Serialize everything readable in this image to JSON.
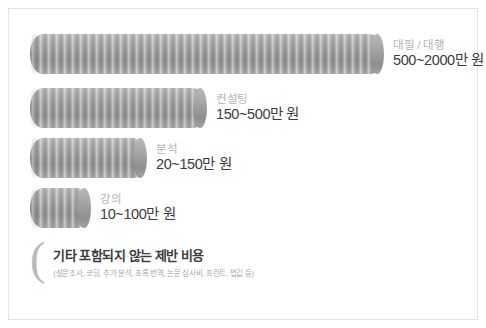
{
  "chart_data": {
    "type": "bar",
    "orientation": "horizontal",
    "title": "",
    "xlabel": "",
    "ylabel": "",
    "categories": [
      "대필 / 대행",
      "컨설팅",
      "분석",
      "강의"
    ],
    "value_labels": [
      "500~2000만 원",
      "150~500만 원",
      "20~150만 원",
      "10~100만 원"
    ],
    "units": "만 원",
    "ranges": [
      {
        "category": "대필 / 대행",
        "min": 500,
        "max": 2000,
        "label": "500~2000만 원"
      },
      {
        "category": "컨설팅",
        "min": 150,
        "max": 500,
        "label": "150~500만 원"
      },
      {
        "category": "분석",
        "min": 20,
        "max": 150,
        "label": "20~150만 원"
      },
      {
        "category": "강의",
        "min": 10,
        "max": 100,
        "label": "10~100만 원"
      }
    ],
    "values": [
      2000,
      500,
      150,
      100
    ],
    "bar_style": "ribbed-cylinder",
    "bar_color": "#9a9a9a",
    "legend": "none",
    "grid": false
  },
  "bars": [
    {
      "category": "대필 / 대행",
      "price": "500~2000만 원"
    },
    {
      "category": "컨설팅",
      "price": "150~500만 원"
    },
    {
      "category": "분석",
      "price": "20~150만 원"
    },
    {
      "category": "강의",
      "price": "10~100만 원"
    }
  ],
  "note": {
    "bracket": "(",
    "title": "기타 포함되지 않는 제반 비용",
    "subtitle": "(설문조사, 코딩, 추가 분석, 초록 번역, 논문 심사비, 프린트, 법깂 등)"
  },
  "colors": {
    "background": "#ffffff",
    "frame": "#e3e3e3",
    "bar": "#9a9a9a",
    "category_text": "#b4b4b4",
    "price_text": "#3c3c3c",
    "note_title": "#3c3c3c",
    "note_sub": "#a9a9a9",
    "bracket": "#b9b9b9"
  }
}
